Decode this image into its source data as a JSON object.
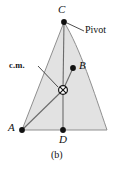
{
  "figure": {
    "caption": "(b)",
    "type": "physics-diagram",
    "background_color": "#ffffff",
    "fill_color": "#e2e2e2",
    "outline_color": "#8a8a8a",
    "line_color": "#6b6b6b",
    "marker_color": "#111111",
    "text_color": "#111111"
  },
  "points": [
    {
      "id": "C",
      "label": "C",
      "x": 64,
      "y": 22,
      "role": "pivot-vertex",
      "marker": "filled-dot"
    },
    {
      "id": "B",
      "label": "B",
      "x": 73,
      "y": 68,
      "role": "vertex",
      "marker": "filled-dot"
    },
    {
      "id": "A",
      "label": "A",
      "x": 22,
      "y": 130,
      "role": "vertex",
      "marker": "filled-dot"
    },
    {
      "id": "D",
      "label": "D",
      "x": 63,
      "y": 130,
      "role": "vertex",
      "marker": "filled-dot"
    },
    {
      "id": "cm",
      "label": "c.m.",
      "x": 63,
      "y": 90,
      "role": "center-of-mass",
      "marker": "crossed-circle"
    }
  ],
  "annotations": [
    {
      "id": "pivot",
      "text": "Pivot",
      "target_point": "C",
      "leader_from_x": 84,
      "leader_from_y": 31,
      "leader_to_x": 67,
      "leader_to_y": 23
    },
    {
      "id": "cm",
      "text": "c.m.",
      "target_point": "cm",
      "leader_from_x": 38,
      "leader_from_y": 66,
      "leader_to_x": 58,
      "leader_to_y": 87
    }
  ],
  "segments": [
    {
      "id": "cm-to-C",
      "from": "cm",
      "to": "C"
    },
    {
      "id": "cm-to-D",
      "from": "cm",
      "to": "D"
    },
    {
      "id": "cm-to-A",
      "from": "cm",
      "to": "A"
    },
    {
      "id": "cm-to-B",
      "from": "cm",
      "to": "B"
    }
  ],
  "outline": {
    "left_edge": "straight line from C to A",
    "bottom_edge": "straight line from A to bottom-right corner",
    "right_edge": "convex curve from C bulging right down to bottom-right corner",
    "bottom_right_x": 107,
    "bottom_right_y": 130
  },
  "labels": {
    "C": "C",
    "B": "B",
    "A": "A",
    "D": "D",
    "pivot": "Pivot",
    "cm": "c.m.",
    "caption": "(b)"
  }
}
